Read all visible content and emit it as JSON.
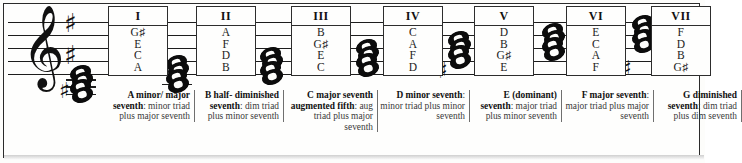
{
  "figure": {
    "clef": "treble-clef",
    "key_signature_accidentals": [
      "sharp",
      "sharp"
    ],
    "glyphs": {
      "treble_clef": "𝄞",
      "sharp": "♯"
    }
  },
  "chords": [
    {
      "numeral": "I",
      "notes": [
        "G♯",
        "E",
        "C",
        "A"
      ],
      "caption_bold": "A minor/ major seventh",
      "caption_rest": ": minor triad plus major seventh",
      "accidental": "sharp"
    },
    {
      "numeral": "II",
      "notes": [
        "A",
        "F",
        "D",
        "B"
      ],
      "caption_bold": "B half- diminished seventh",
      "caption_rest": ": dim triad plus minor seventh",
      "accidental": "none"
    },
    {
      "numeral": "III",
      "notes": [
        "B",
        "G♯",
        "E",
        "C"
      ],
      "caption_bold": "C major seventh augmented fifth",
      "caption_rest": ": aug triad plus major seventh",
      "accidental": "none"
    },
    {
      "numeral": "IV",
      "notes": [
        "C",
        "A",
        "F",
        "D"
      ],
      "caption_bold": "D minor seventh",
      "caption_rest": ": minor triad plus minor seventh",
      "accidental": "none"
    },
    {
      "numeral": "V",
      "notes": [
        "D",
        "B",
        "G♯",
        "E"
      ],
      "caption_bold": "E (dominant) seventh",
      "caption_rest": ": major triad plus minor seventh",
      "accidental": "sharp"
    },
    {
      "numeral": "VI",
      "notes": [
        "E",
        "C",
        "A",
        "F"
      ],
      "caption_bold": "F major seventh",
      "caption_rest": ": major triad plus major seventh",
      "accidental": "none"
    },
    {
      "numeral": "VII",
      "notes": [
        "F",
        "D",
        "B",
        "G♯"
      ],
      "caption_bold": "G diminished seventh",
      "caption_rest": ": dim triad plus dim seventh",
      "accidental": "sharp"
    }
  ],
  "colors": {
    "ink": "#111111",
    "caption_text": "#3a3a3a",
    "border": "#2b2b2b",
    "paper": "#fefefd"
  }
}
